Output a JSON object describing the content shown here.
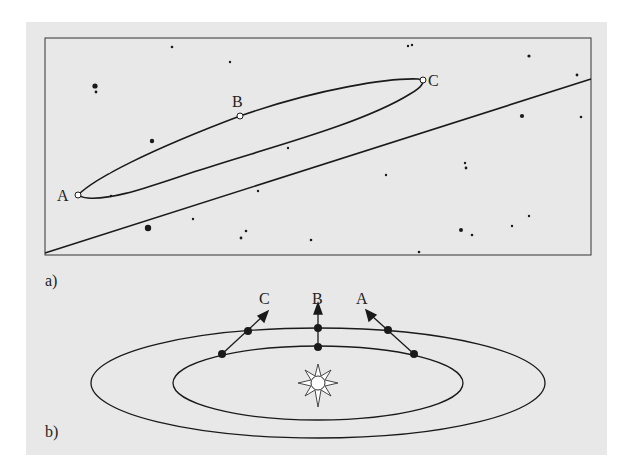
{
  "figure": {
    "panel_a": {
      "label": "a)",
      "description": "Apparent retrograde path of a planet against background stars",
      "points": [
        {
          "id": "A",
          "label": "A",
          "x": 78,
          "y": 195
        },
        {
          "id": "B",
          "label": "B",
          "x": 240,
          "y": 116
        },
        {
          "id": "C",
          "label": "C",
          "x": 423,
          "y": 80
        }
      ],
      "ecliptic_line": {
        "x1": 45,
        "y1": 253,
        "x2": 591,
        "y2": 79
      },
      "stars": [
        [
          172,
          47,
          1.3
        ],
        [
          230,
          62,
          1.2
        ],
        [
          95,
          86,
          2.6
        ],
        [
          96,
          92,
          1.4
        ],
        [
          152,
          141,
          2.2
        ],
        [
          258,
          191,
          1.2
        ],
        [
          193,
          219,
          1.2
        ],
        [
          148,
          228,
          3.2
        ],
        [
          246,
          231,
          1.3
        ],
        [
          241,
          238,
          1.4
        ],
        [
          311,
          240,
          1.3
        ],
        [
          111,
          196,
          1.2
        ],
        [
          288,
          148,
          1.2
        ],
        [
          408,
          46,
          1.2
        ],
        [
          412,
          45,
          1.2
        ],
        [
          529,
          56,
          1.6
        ],
        [
          577,
          75,
          1.4
        ],
        [
          522,
          116,
          2.1
        ],
        [
          581,
          117,
          1.3
        ],
        [
          465,
          163,
          1.2
        ],
        [
          466,
          168,
          1.4
        ],
        [
          386,
          175,
          1.2
        ],
        [
          461,
          230,
          2.0
        ],
        [
          472,
          235,
          1.3
        ],
        [
          512,
          226,
          1.2
        ],
        [
          529,
          216,
          1.2
        ],
        [
          419,
          252,
          1.3
        ]
      ]
    },
    "panel_b": {
      "label": "b)",
      "description": "Earth and planet orbits around the Sun with sight lines",
      "sight_lines": [
        {
          "label": "C",
          "from": [
            222,
            354
          ],
          "via": [
            248,
            331
          ],
          "to": [
            266,
            313
          ]
        },
        {
          "label": "B",
          "from": [
            318,
            347
          ],
          "via": [
            318,
            328
          ],
          "to": [
            318,
            306
          ]
        },
        {
          "label": "A",
          "from": [
            414,
            354
          ],
          "via": [
            388,
            330
          ],
          "to": [
            368,
            312
          ]
        }
      ],
      "sun": {
        "x": 318,
        "y": 383
      }
    },
    "colors": {
      "background": "#e8e8e8",
      "ink": "#1a1a1a",
      "page": "#ffffff"
    }
  }
}
